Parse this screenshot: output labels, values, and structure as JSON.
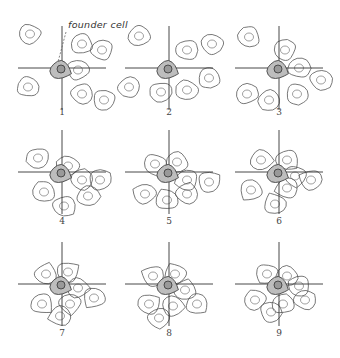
{
  "annotation": {
    "text": "founder cell",
    "x": 68,
    "y": 28,
    "leader_from": [
      66,
      32
    ],
    "leader_to": [
      58,
      62
    ]
  },
  "colors": {
    "background": "#ffffff",
    "outline": "#555555",
    "founder_fill": "#bdbdbd",
    "axis": "#333333"
  },
  "panels": [
    {
      "label": "1",
      "cx": 60,
      "cy": 72,
      "label_y": 115,
      "cells": [
        [
          -30,
          -38
        ],
        [
          22,
          -28
        ],
        [
          42,
          -22
        ],
        [
          18,
          -2
        ],
        [
          -32,
          15
        ],
        [
          22,
          22
        ],
        [
          44,
          28
        ]
      ]
    },
    {
      "label": "2",
      "cx": 167,
      "cy": 72,
      "label_y": 115,
      "cells": [
        [
          -28,
          -36
        ],
        [
          20,
          -22
        ],
        [
          45,
          -28
        ],
        [
          42,
          6
        ],
        [
          -38,
          15
        ],
        [
          -6,
          20
        ],
        [
          20,
          18
        ]
      ]
    },
    {
      "label": "3",
      "cx": 277,
      "cy": 72,
      "label_y": 115,
      "cells": [
        [
          -28,
          -35
        ],
        [
          8,
          -22
        ],
        [
          -30,
          22
        ],
        [
          22,
          -4
        ],
        [
          44,
          8
        ],
        [
          20,
          22
        ],
        [
          -8,
          28
        ]
      ]
    },
    {
      "label": "4",
      "cx": 60,
      "cy": 176,
      "label_y": 224,
      "cells": [
        [
          -22,
          -18
        ],
        [
          8,
          -10
        ],
        [
          -16,
          16
        ],
        [
          22,
          4
        ],
        [
          40,
          4
        ],
        [
          28,
          20
        ],
        [
          4,
          30
        ]
      ]
    },
    {
      "label": "5",
      "cx": 167,
      "cy": 176,
      "label_y": 224,
      "cells": [
        [
          -12,
          -12
        ],
        [
          10,
          -14
        ],
        [
          20,
          4
        ],
        [
          -22,
          18
        ],
        [
          0,
          24
        ],
        [
          20,
          18
        ],
        [
          42,
          6
        ]
      ]
    },
    {
      "label": "6",
      "cx": 277,
      "cy": 176,
      "label_y": 224,
      "cells": [
        [
          -16,
          -16
        ],
        [
          10,
          -16
        ],
        [
          18,
          0
        ],
        [
          -26,
          14
        ],
        [
          10,
          12
        ],
        [
          34,
          4
        ],
        [
          -2,
          28
        ]
      ]
    },
    {
      "label": "7",
      "cx": 60,
      "cy": 288,
      "label_y": 336,
      "cells": [
        [
          -14,
          -14
        ],
        [
          8,
          -16
        ],
        [
          18,
          0
        ],
        [
          -18,
          16
        ],
        [
          10,
          16
        ],
        [
          34,
          10
        ],
        [
          0,
          28
        ]
      ]
    },
    {
      "label": "8",
      "cx": 167,
      "cy": 288,
      "label_y": 336,
      "cells": [
        [
          -14,
          -12
        ],
        [
          8,
          -14
        ],
        [
          18,
          2
        ],
        [
          -18,
          16
        ],
        [
          6,
          18
        ],
        [
          30,
          16
        ],
        [
          -8,
          30
        ]
      ]
    },
    {
      "label": "9",
      "cx": 277,
      "cy": 288,
      "label_y": 336,
      "cells": [
        [
          -10,
          -14
        ],
        [
          10,
          -12
        ],
        [
          22,
          -2
        ],
        [
          -22,
          12
        ],
        [
          6,
          16
        ],
        [
          28,
          12
        ],
        [
          -6,
          24
        ]
      ]
    }
  ]
}
